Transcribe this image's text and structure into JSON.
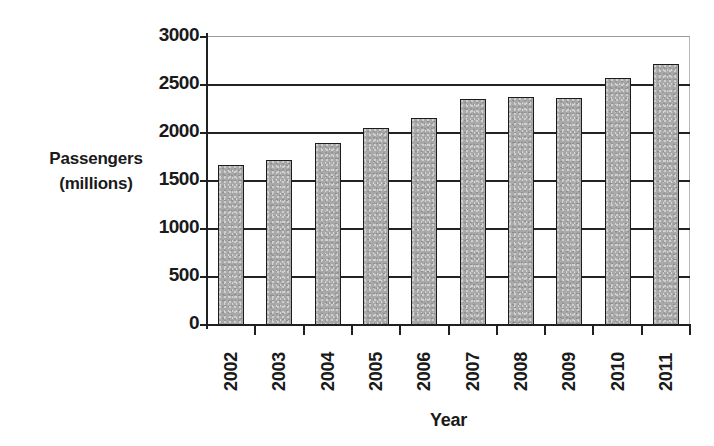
{
  "chart_data": {
    "type": "bar",
    "title": "",
    "xlabel": "Year",
    "ylabel": "Passengers (millions)",
    "ylabel_line1": "Passengers",
    "ylabel_line2": "(millions)",
    "categories": [
      "2002",
      "2003",
      "2004",
      "2005",
      "2006",
      "2007",
      "2008",
      "2009",
      "2010",
      "2011"
    ],
    "values": [
      1670,
      1720,
      1900,
      2050,
      2160,
      2350,
      2380,
      2360,
      2570,
      2720
    ],
    "series": [
      {
        "name": "Passengers",
        "values": [
          1670,
          1720,
          1900,
          2050,
          2160,
          2350,
          2380,
          2360,
          2570,
          2720
        ]
      }
    ],
    "ylim": [
      0,
      3000
    ],
    "ytick_labels": [
      "0",
      "500",
      "1000",
      "1500",
      "2000",
      "2500",
      "3000"
    ],
    "ytick_values": [
      0,
      500,
      1000,
      1500,
      2000,
      2500,
      3000
    ],
    "grid": true,
    "grid_axis": "y",
    "legend": false,
    "legend_position": "none",
    "bar_color": "#a9a9a9",
    "bar_edge_color": "#1c1c1c",
    "axis_color": "#202020",
    "background_color": "#ffffff"
  }
}
